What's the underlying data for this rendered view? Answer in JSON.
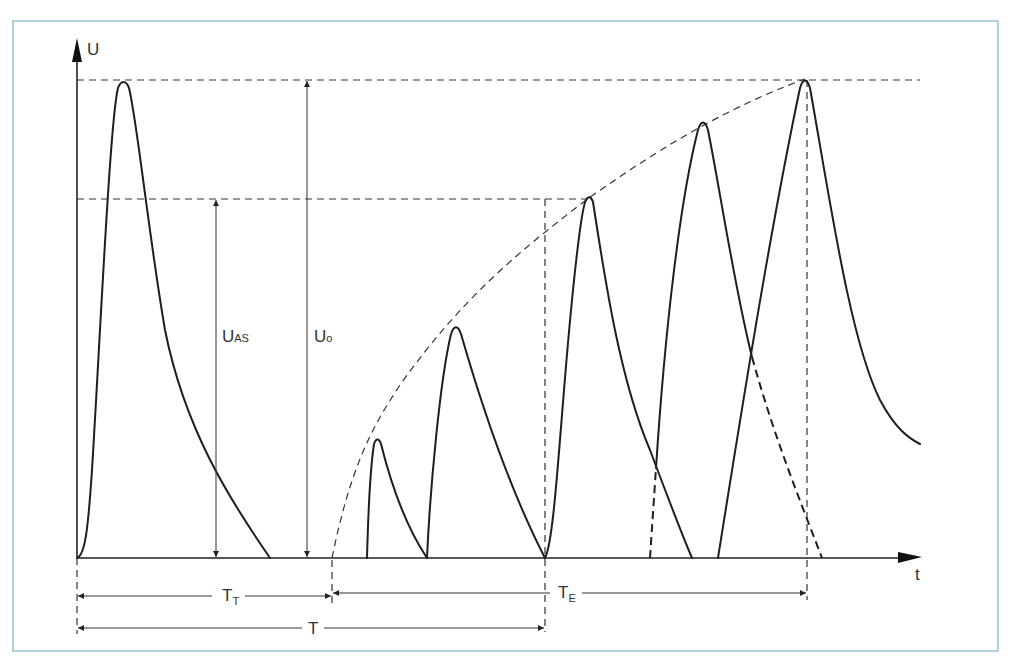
{
  "diagram": {
    "axes": {
      "y_label": "U",
      "x_label": "t"
    },
    "voltage_labels": {
      "u_as": {
        "main": "U",
        "sub": "AS"
      },
      "u_0": {
        "main": "U",
        "sub": "o"
      }
    },
    "time_labels": {
      "t_t": {
        "main": "T",
        "sub": "T"
      },
      "t_e": {
        "main": "T",
        "sub": "E"
      },
      "t": {
        "main": "T"
      }
    },
    "colors": {
      "frame": "#8fc3d6",
      "line": "#1e1e1e"
    },
    "pulses": [
      {
        "start_x": 77,
        "peak": [
          123,
          82
        ],
        "end_x": 270
      },
      {
        "start_x": 367,
        "peak": [
          377,
          440
        ],
        "end_x": 427
      },
      {
        "start_x": 427,
        "peak": [
          456,
          328
        ],
        "end_x": 545
      },
      {
        "start_x": 545,
        "peak": [
          589,
          198
        ],
        "end_x": 692
      },
      {
        "start_x": 650,
        "peak": [
          703,
          122
        ],
        "end_x": 822
      },
      {
        "start_x": 718,
        "peak": [
          805,
          79
        ],
        "end": [
          920,
          444
        ]
      }
    ]
  }
}
